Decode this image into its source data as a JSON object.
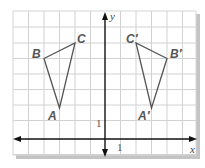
{
  "diagram": {
    "grid": {
      "x_min": -6,
      "x_max": 6,
      "y_min": -1,
      "y_max": 8,
      "unit_px": 15.5,
      "origin_px": [
        105,
        139
      ]
    },
    "axes": {
      "x_label": "x",
      "y_label": "y",
      "x_tick_label": "1",
      "y_tick_label": "1"
    },
    "triangles": [
      {
        "name": "ABC",
        "vertices": [
          {
            "label": "A",
            "coord": [
              -3,
              2
            ]
          },
          {
            "label": "B",
            "coord": [
              -4,
              5
            ]
          },
          {
            "label": "C",
            "coord": [
              -2,
              6
            ]
          }
        ]
      },
      {
        "name": "A'B'C'",
        "vertices": [
          {
            "label": "A′",
            "coord": [
              3,
              2
            ]
          },
          {
            "label": "B′",
            "coord": [
              4,
              5
            ]
          },
          {
            "label": "C′",
            "coord": [
              2,
              6
            ]
          }
        ]
      }
    ],
    "colors": {
      "grid": "#cfcfcf",
      "axis": "#111111",
      "triangle": "#555555",
      "label": "#555555",
      "shadow": "#bdbdbd"
    }
  }
}
